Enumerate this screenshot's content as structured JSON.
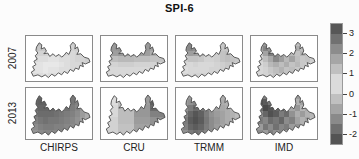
{
  "figure": {
    "background": "#fcfcfc",
    "outline_color": "#4a4a4a",
    "panel_border_color": "#8a8a8a"
  },
  "chart_data": {
    "type": "heatmap",
    "title": "SPI-6",
    "subtitle": "",
    "rows": [
      "2007",
      "2013"
    ],
    "columns": [
      "CHIRPS",
      "CRU",
      "TRMM",
      "IMD"
    ],
    "region": "Bihar state outline map",
    "colorbar": {
      "range": [
        -2.5,
        3.5
      ],
      "ticks": [
        3,
        2,
        1,
        0,
        -1,
        -2
      ],
      "step": 0.5,
      "lightest_hex": "#e8e8e8",
      "darkest_hex": "#4a4a4a",
      "position": "right"
    },
    "panels": [
      {
        "row": "2007",
        "column": "CHIRPS",
        "grid": [
          [
            1.4,
            1.4,
            1.3,
            1.2,
            1.2,
            1.1,
            1.1,
            1.0,
            1.0,
            1.0,
            1.1,
            1.1
          ],
          [
            1.2,
            1.2,
            1.1,
            1.1,
            1.0,
            1.0,
            1.0,
            0.9,
            0.9,
            1.0,
            1.0,
            1.1
          ],
          [
            1.0,
            1.0,
            0.9,
            0.9,
            0.8,
            0.8,
            0.8,
            0.8,
            0.8,
            0.9,
            1.0,
            1.0
          ],
          [
            0.8,
            0.8,
            0.7,
            0.7,
            0.6,
            0.6,
            0.7,
            0.7,
            0.8,
            0.9,
            0.9,
            1.0
          ],
          [
            0.7,
            0.6,
            0.6,
            0.5,
            0.5,
            0.5,
            0.6,
            0.7,
            0.8,
            0.8,
            0.9,
            0.9
          ],
          [
            0.7,
            0.6,
            0.6,
            0.5,
            0.6,
            0.6,
            0.7,
            0.7,
            0.8,
            0.8,
            0.9,
            0.9
          ],
          [
            0.8,
            0.7,
            0.7,
            0.6,
            0.7,
            0.7,
            0.8,
            0.8,
            0.8,
            0.9,
            0.9,
            0.9
          ]
        ]
      },
      {
        "row": "2007",
        "column": "CRU",
        "grid": [
          [
            2.0,
            2.0,
            2.0,
            2.1,
            2.1,
            2.1,
            2.0,
            2.0,
            2.0,
            1.8,
            1.8,
            1.8
          ],
          [
            2.0,
            2.0,
            2.0,
            2.1,
            2.1,
            2.1,
            2.0,
            2.0,
            2.0,
            1.8,
            1.8,
            1.8
          ],
          [
            1.9,
            1.9,
            1.9,
            2.0,
            2.0,
            2.0,
            1.9,
            1.9,
            1.9,
            1.6,
            1.6,
            1.6
          ],
          [
            1.3,
            1.3,
            1.3,
            1.4,
            1.4,
            1.4,
            1.3,
            1.3,
            1.3,
            1.2,
            1.2,
            1.2
          ],
          [
            0.9,
            0.9,
            0.9,
            1.0,
            1.0,
            1.0,
            0.9,
            0.9,
            0.9,
            0.9,
            0.9,
            0.9
          ],
          [
            0.8,
            0.8,
            0.8,
            0.8,
            0.8,
            0.8,
            0.8,
            0.8,
            0.8,
            0.8,
            0.8,
            0.8
          ],
          [
            0.8,
            0.8,
            0.8,
            0.8,
            0.8,
            0.8,
            0.8,
            0.8,
            0.8,
            0.8,
            0.8,
            0.8
          ]
        ]
      },
      {
        "row": "2007",
        "column": "TRMM",
        "grid": [
          [
            2.0,
            2.2,
            2.3,
            2.3,
            2.1,
            1.8,
            1.5,
            1.2,
            1.1,
            1.0,
            1.0,
            1.0
          ],
          [
            1.9,
            2.2,
            2.3,
            2.2,
            2.0,
            1.6,
            1.3,
            1.2,
            1.1,
            1.1,
            1.0,
            1.0
          ],
          [
            1.4,
            1.7,
            1.9,
            1.8,
            1.6,
            1.3,
            1.1,
            1.0,
            1.2,
            1.3,
            1.2,
            1.1
          ],
          [
            0.9,
            1.0,
            1.2,
            1.2,
            1.1,
            0.9,
            0.9,
            1.0,
            1.2,
            1.3,
            1.2,
            1.1
          ],
          [
            0.7,
            0.8,
            0.8,
            0.9,
            0.8,
            0.8,
            0.8,
            0.9,
            1.0,
            1.1,
            1.0,
            1.0
          ],
          [
            0.7,
            0.7,
            0.8,
            0.8,
            0.8,
            0.8,
            0.9,
            0.9,
            1.0,
            1.0,
            1.0,
            0.9
          ],
          [
            0.8,
            0.8,
            0.8,
            0.9,
            0.9,
            0.9,
            0.9,
            1.0,
            1.0,
            1.0,
            0.9,
            0.9
          ]
        ]
      },
      {
        "row": "2007",
        "column": "IMD",
        "grid": [
          [
            1.2,
            1.5,
            2.0,
            1.8,
            2.3,
            1.6,
            1.4,
            1.7,
            1.3,
            1.2,
            1.4,
            1.2
          ],
          [
            1.0,
            1.8,
            2.4,
            2.1,
            1.7,
            2.2,
            1.5,
            1.3,
            1.6,
            1.3,
            1.2,
            1.1
          ],
          [
            0.9,
            1.2,
            1.8,
            2.5,
            2.2,
            1.6,
            2.0,
            1.4,
            1.2,
            1.5,
            1.3,
            1.0
          ],
          [
            0.8,
            0.9,
            1.3,
            1.7,
            2.3,
            1.9,
            1.4,
            1.8,
            1.3,
            1.1,
            1.2,
            1.0
          ],
          [
            0.7,
            0.8,
            1.0,
            1.4,
            1.6,
            1.3,
            1.6,
            1.2,
            1.4,
            1.1,
            1.0,
            0.9
          ],
          [
            0.7,
            0.8,
            0.9,
            1.1,
            1.3,
            1.5,
            1.2,
            1.3,
            1.1,
            1.0,
            0.9,
            0.9
          ],
          [
            0.8,
            0.8,
            0.9,
            1.0,
            1.2,
            1.1,
            1.2,
            1.0,
            1.0,
            0.9,
            0.9,
            0.8
          ]
        ]
      },
      {
        "row": "2013",
        "column": "CHIRPS",
        "grid": [
          [
            -1.6,
            -1.8,
            -1.9,
            -2.0,
            -1.9,
            -1.8,
            -1.8,
            -1.7,
            -1.6,
            -1.4,
            -1.2,
            -1.0
          ],
          [
            -1.7,
            -1.9,
            -2.0,
            -2.0,
            -2.0,
            -1.9,
            -1.8,
            -1.8,
            -1.6,
            -1.4,
            -1.1,
            -0.8
          ],
          [
            -1.6,
            -1.8,
            -1.9,
            -1.9,
            -1.9,
            -1.8,
            -1.8,
            -1.7,
            -1.5,
            -1.3,
            -1.0,
            -0.7
          ],
          [
            -1.4,
            -1.6,
            -1.8,
            -1.8,
            -1.8,
            -1.7,
            -1.6,
            -1.5,
            -1.4,
            -1.2,
            -0.9,
            -0.6
          ],
          [
            -1.2,
            -1.4,
            -1.6,
            -1.7,
            -1.6,
            -1.6,
            -1.5,
            -1.4,
            -1.3,
            -1.1,
            -0.8,
            -0.6
          ],
          [
            -0.9,
            -1.2,
            -1.4,
            -1.5,
            -1.5,
            -1.4,
            -1.4,
            -1.3,
            -1.2,
            -1.0,
            -0.8,
            -0.5
          ],
          [
            -0.7,
            -1.0,
            -1.2,
            -1.3,
            -1.3,
            -1.3,
            -1.2,
            -1.1,
            -1.0,
            -0.9,
            -0.7,
            -0.5
          ]
        ]
      },
      {
        "row": "2013",
        "column": "CRU",
        "grid": [
          [
            0.3,
            0.3,
            0.3,
            -0.2,
            -0.2,
            -0.2,
            -0.9,
            -0.9,
            -0.9,
            -2.0,
            -2.0,
            -2.0
          ],
          [
            0.3,
            0.3,
            0.3,
            -0.2,
            -0.2,
            -0.2,
            -0.9,
            -0.9,
            -0.9,
            -2.0,
            -2.0,
            -2.0
          ],
          [
            0.2,
            0.2,
            0.2,
            -0.3,
            -0.3,
            -0.3,
            -1.0,
            -1.0,
            -1.0,
            -1.8,
            -1.8,
            -1.8
          ],
          [
            0.2,
            0.2,
            0.2,
            -0.3,
            -0.3,
            -0.3,
            -1.0,
            -1.0,
            -1.0,
            -1.4,
            -1.4,
            -1.4
          ],
          [
            0.1,
            0.1,
            0.1,
            -0.3,
            -0.3,
            -0.3,
            -0.9,
            -0.9,
            -0.9,
            -1.1,
            -1.1,
            -1.1
          ],
          [
            0.1,
            0.1,
            0.1,
            -0.2,
            -0.2,
            -0.2,
            -0.8,
            -0.8,
            -0.8,
            -0.9,
            -0.9,
            -0.9
          ],
          [
            0.1,
            0.1,
            0.1,
            -0.2,
            -0.2,
            -0.2,
            -0.7,
            -0.7,
            -0.7,
            -0.8,
            -0.8,
            -0.8
          ]
        ]
      },
      {
        "row": "2013",
        "column": "TRMM",
        "grid": [
          [
            -0.6,
            -0.8,
            -0.9,
            -1.0,
            -1.0,
            -0.9,
            -0.8,
            -0.7,
            -0.6,
            -0.5,
            -0.4,
            -0.4
          ],
          [
            -0.7,
            -0.9,
            -1.1,
            -1.3,
            -1.2,
            -1.0,
            -0.9,
            -0.8,
            -0.6,
            -0.5,
            -0.4,
            -0.3
          ],
          [
            -0.8,
            -1.1,
            -1.5,
            -1.8,
            -1.6,
            -1.3,
            -1.0,
            -0.8,
            -0.7,
            -0.6,
            -0.4,
            -0.3
          ],
          [
            -0.9,
            -1.3,
            -1.9,
            -2.2,
            -2.0,
            -1.5,
            -1.1,
            -0.9,
            -0.8,
            -0.6,
            -0.5,
            -0.3
          ],
          [
            -1.0,
            -1.5,
            -2.1,
            -2.3,
            -2.1,
            -1.6,
            -1.2,
            -1.0,
            -0.8,
            -0.6,
            -0.5,
            -0.4
          ],
          [
            -0.9,
            -1.4,
            -1.9,
            -2.1,
            -1.9,
            -1.5,
            -1.2,
            -0.9,
            -0.7,
            -0.6,
            -0.4,
            -0.3
          ],
          [
            -0.7,
            -1.1,
            -1.5,
            -1.7,
            -1.6,
            -1.3,
            -1.0,
            -0.8,
            -0.6,
            -0.5,
            -0.4,
            -0.3
          ]
        ]
      },
      {
        "row": "2013",
        "column": "IMD",
        "grid": [
          [
            -1.2,
            -2.0,
            -1.4,
            -2.2,
            -1.8,
            -1.0,
            -0.8,
            -0.6,
            -0.9,
            -0.5,
            -0.7,
            -0.4
          ],
          [
            -1.6,
            -2.3,
            -2.1,
            -1.6,
            -2.2,
            -1.4,
            -1.0,
            -0.9,
            -0.5,
            -0.8,
            -0.4,
            -0.6
          ],
          [
            -1.0,
            -1.8,
            -2.4,
            -2.2,
            -1.9,
            -2.1,
            -1.3,
            -0.7,
            -1.0,
            -0.4,
            -0.7,
            -0.3
          ],
          [
            -1.4,
            -1.2,
            -1.9,
            -2.3,
            -2.1,
            -1.5,
            -1.8,
            -1.1,
            -0.6,
            -0.9,
            -0.5,
            -0.4
          ],
          [
            -0.8,
            -1.5,
            -1.3,
            -1.8,
            -1.6,
            -1.9,
            -1.2,
            -1.4,
            -0.8,
            -0.5,
            -0.7,
            -0.3
          ],
          [
            -1.1,
            -0.9,
            -1.6,
            -1.2,
            -1.7,
            -1.3,
            -1.5,
            -0.9,
            -1.1,
            -0.6,
            -0.4,
            -0.5
          ],
          [
            -0.7,
            -1.2,
            -0.9,
            -1.4,
            -1.1,
            -1.3,
            -0.8,
            -1.0,
            -0.6,
            -0.8,
            -0.4,
            -0.3
          ]
        ]
      }
    ]
  }
}
